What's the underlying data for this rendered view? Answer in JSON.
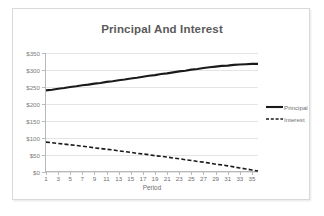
{
  "chart_data": {
    "type": "line",
    "title": "Principal And Interest",
    "xlabel": "Period",
    "ylabel": "",
    "xlim": [
      1,
      36
    ],
    "ylim": [
      0,
      350
    ],
    "grid": true,
    "legend_position": "right",
    "y_ticks": [
      "$0",
      "$50",
      "$100",
      "$150",
      "$200",
      "$250",
      "$300",
      "$350"
    ],
    "y_tick_values": [
      0,
      50,
      100,
      150,
      200,
      250,
      300,
      350
    ],
    "x_ticks": [
      "1",
      "3",
      "5",
      "7",
      "9",
      "11",
      "13",
      "15",
      "17",
      "19",
      "21",
      "23",
      "25",
      "27",
      "29",
      "31",
      "33",
      "35"
    ],
    "x_tick_values": [
      1,
      3,
      5,
      7,
      9,
      11,
      13,
      15,
      17,
      19,
      21,
      23,
      25,
      27,
      29,
      31,
      33,
      35
    ],
    "x": [
      1,
      2,
      3,
      4,
      5,
      6,
      7,
      8,
      9,
      10,
      11,
      12,
      13,
      14,
      15,
      16,
      17,
      18,
      19,
      20,
      21,
      22,
      23,
      24,
      25,
      26,
      27,
      28,
      29,
      30,
      31,
      32,
      33,
      34,
      35,
      36
    ],
    "series": [
      {
        "name": "Principal",
        "style": "solid",
        "color": "#1a1a1a",
        "width": 2.1,
        "values": [
          240,
          242,
          245,
          247,
          250,
          252,
          255,
          257,
          260,
          262,
          265,
          267,
          270,
          272,
          275,
          277,
          280,
          283,
          285,
          288,
          290,
          293,
          296,
          298,
          301,
          303,
          306,
          308,
          310,
          312,
          313,
          315,
          316,
          317,
          318,
          318
        ]
      },
      {
        "name": "Interest",
        "style": "dashed",
        "color": "#1a1a1a",
        "width": 1.6,
        "values": [
          88,
          86,
          84,
          82,
          80,
          78,
          76,
          74,
          71,
          69,
          67,
          65,
          62,
          60,
          58,
          55,
          53,
          51,
          48,
          46,
          44,
          41,
          39,
          36,
          34,
          31,
          29,
          26,
          23,
          21,
          18,
          15,
          12,
          9,
          6,
          3
        ]
      }
    ]
  },
  "legend": {
    "items": [
      {
        "label": "Principal",
        "style": "solid"
      },
      {
        "label": "Interest",
        "style": "dashed"
      }
    ]
  },
  "colors": {
    "title": "#5a5a5a",
    "tick_text": "#7d7d7d",
    "gridline": "#e4e4e4",
    "axis": "#b9b9b9",
    "series": "#1a1a1a",
    "frame_border": "#d9d9d9",
    "background": "#ffffff"
  }
}
